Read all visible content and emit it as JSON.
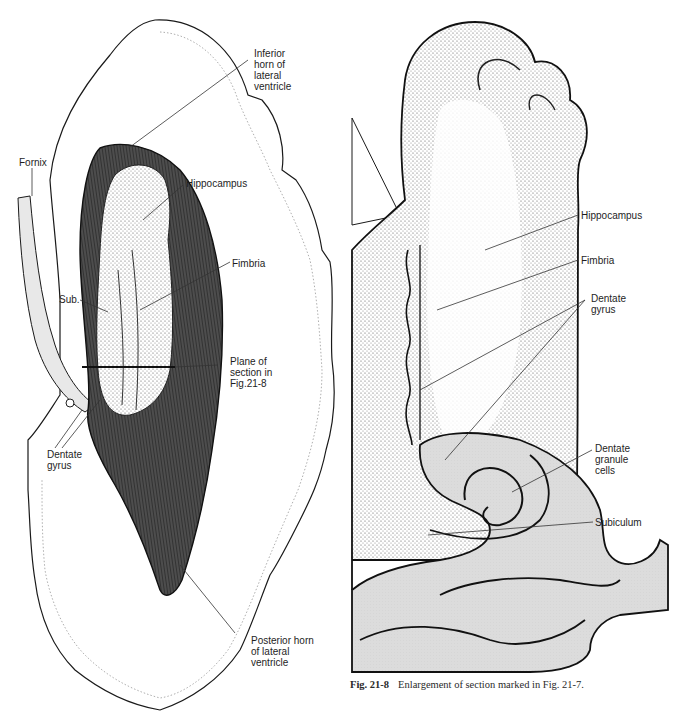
{
  "figure_left": {
    "name": "Fig. 21-7 illustration",
    "labels": {
      "inferior_horn": "Inferior\nhorn of\nlateral\nventricle",
      "fornix": "Fornix",
      "hippocampus": "Hippocampus",
      "fimbria": "Fimbria",
      "sub": "Sub.",
      "plane_of_section": "Plane of\nsection in\nFig.21-8",
      "dentate_gyrus": "Dentate\ngyrus",
      "posterior_horn": "Posterior horn\nof lateral\nventricle"
    }
  },
  "figure_right": {
    "name": "Fig. 21-8 illustration",
    "labels": {
      "hippocampus": "Hippocampus",
      "fimbria": "Fimbria",
      "dentate_gyrus": "Dentate\ngyrus",
      "dentate_granule_cells": "Dentate\ngranule\ncells",
      "subiculum": "Subiculum"
    },
    "caption": {
      "number": "Fig. 21-8",
      "text": "Enlargement of section marked in Fig. 21-7."
    }
  },
  "colors": {
    "ink": "#1a1a1a",
    "shade_fill": "#dcdcdc",
    "dark_fill": "#2b2b2b",
    "paper": "#ffffff"
  }
}
